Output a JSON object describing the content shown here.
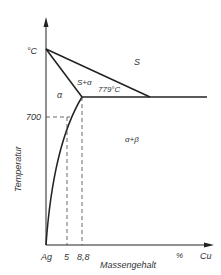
{
  "diagram": {
    "type": "phase-diagram",
    "system": "Ag-Cu",
    "axes": {
      "y_label": "Temperatur",
      "y_unit": "°C",
      "y_tick": "700",
      "x_label": "Massengehalt",
      "x_unit": "%",
      "x_start": "Ag",
      "x_end": "Cu",
      "x_ticks": [
        "5",
        "8,8"
      ]
    },
    "regions": {
      "liquid": "S",
      "liquid_alpha": "S+α",
      "alpha": "α",
      "alpha_beta": "α+β"
    },
    "eutectic_label": "779°C",
    "colors": {
      "line": "#222222",
      "text": "#333333",
      "background": "#ffffff"
    }
  }
}
